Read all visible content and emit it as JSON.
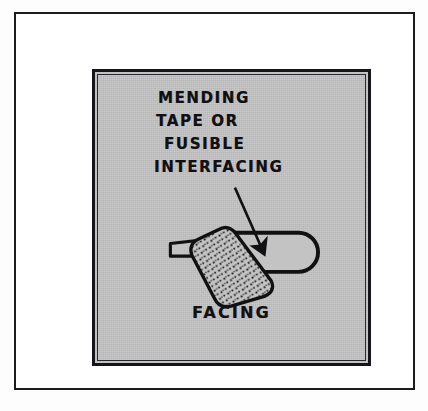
{
  "figure": {
    "type": "sewing-instruction-illustration",
    "page_background": "#ffffff",
    "outer_frame_color": "#1c1c1c",
    "panel_background": "#c3c3c3",
    "ink_color": "#111113",
    "caption": {
      "lines": [
        "MENDING",
        "TAPE OR",
        "FUSIBLE",
        "INTERFACING"
      ],
      "full_text": "MENDING TAPE OR FUSIBLE INTERFACING"
    },
    "bottom_label": "FACING",
    "annotations": [
      {
        "name": "leader-arrow",
        "points_from": "caption",
        "points_to": "stippled-patch"
      }
    ],
    "shapes": [
      {
        "name": "facing-tube",
        "description": "rounded-end tube representing folded facing"
      },
      {
        "name": "thin-strip",
        "description": "narrow strip entering from left"
      },
      {
        "name": "stippled-patch",
        "description": "dotted angled patch of mending tape or fusible interfacing"
      }
    ]
  }
}
